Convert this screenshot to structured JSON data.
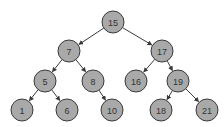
{
  "diagram": {
    "type": "binary-search-tree",
    "node_fill": "#a9a9a9",
    "node_stroke": "#3a3a3a",
    "edge_color": "#3a3a3a",
    "nodes": [
      {
        "id": "n15",
        "label": "15",
        "x": 113,
        "y": 22
      },
      {
        "id": "n7",
        "label": "7",
        "x": 69,
        "y": 51
      },
      {
        "id": "n17",
        "label": "17",
        "x": 162,
        "y": 51
      },
      {
        "id": "n5",
        "label": "5",
        "x": 45,
        "y": 81
      },
      {
        "id": "n8",
        "label": "8",
        "x": 93,
        "y": 81
      },
      {
        "id": "n16",
        "label": "16",
        "x": 136,
        "y": 81
      },
      {
        "id": "n19",
        "label": "19",
        "x": 178,
        "y": 81
      },
      {
        "id": "n1",
        "label": "1",
        "x": 22,
        "y": 110
      },
      {
        "id": "n6",
        "label": "6",
        "x": 67,
        "y": 110
      },
      {
        "id": "n10",
        "label": "10",
        "x": 112,
        "y": 110
      },
      {
        "id": "n18",
        "label": "18",
        "x": 161,
        "y": 110
      },
      {
        "id": "n21",
        "label": "21",
        "x": 207,
        "y": 110
      }
    ],
    "edges": [
      {
        "from": "15",
        "to": "7"
      },
      {
        "from": "15",
        "to": "17"
      },
      {
        "from": "7",
        "to": "5"
      },
      {
        "from": "7",
        "to": "8"
      },
      {
        "from": "17",
        "to": "16"
      },
      {
        "from": "17",
        "to": "19"
      },
      {
        "from": "5",
        "to": "1"
      },
      {
        "from": "5",
        "to": "6"
      },
      {
        "from": "8",
        "to": "10"
      },
      {
        "from": "19",
        "to": "18"
      },
      {
        "from": "19",
        "to": "21"
      }
    ]
  }
}
